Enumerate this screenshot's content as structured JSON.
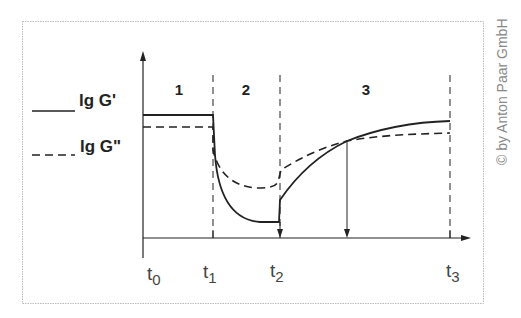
{
  "legend": {
    "g_prime": {
      "label": "lg G'",
      "line_style": "solid"
    },
    "g_double_prime": {
      "label": "lg G\"",
      "line_style": "dashed"
    }
  },
  "phases": [
    {
      "label": "1"
    },
    {
      "label": "2"
    },
    {
      "label": "3"
    }
  ],
  "time_ticks": [
    {
      "base": "t",
      "sub": "0"
    },
    {
      "base": "t",
      "sub": "1"
    },
    {
      "base": "t",
      "sub": "2"
    },
    {
      "base": "t",
      "sub": "3"
    }
  ],
  "copyright": "© by Anton Paar GmbH",
  "colors": {
    "line": "#222222",
    "frame": "#bbbbbb",
    "text": "#222222",
    "tick_text": "#555555",
    "copyright": "#888888"
  }
}
